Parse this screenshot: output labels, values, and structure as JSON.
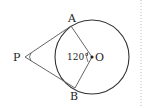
{
  "diagram": {
    "type": "geometry",
    "points": {
      "P": {
        "label": "P",
        "x": 24,
        "y": 57
      },
      "A": {
        "label": "A",
        "x": 71,
        "y": 25
      },
      "B": {
        "label": "B",
        "x": 75,
        "y": 89
      },
      "O": {
        "label": "O",
        "x": 91,
        "y": 57
      }
    },
    "circle": {
      "center": "O",
      "radius": 37
    },
    "angle_label": "120°",
    "colors": {
      "stroke": "#333333",
      "background": "#ffffff",
      "dotted_border": "#bbbbbb"
    }
  }
}
